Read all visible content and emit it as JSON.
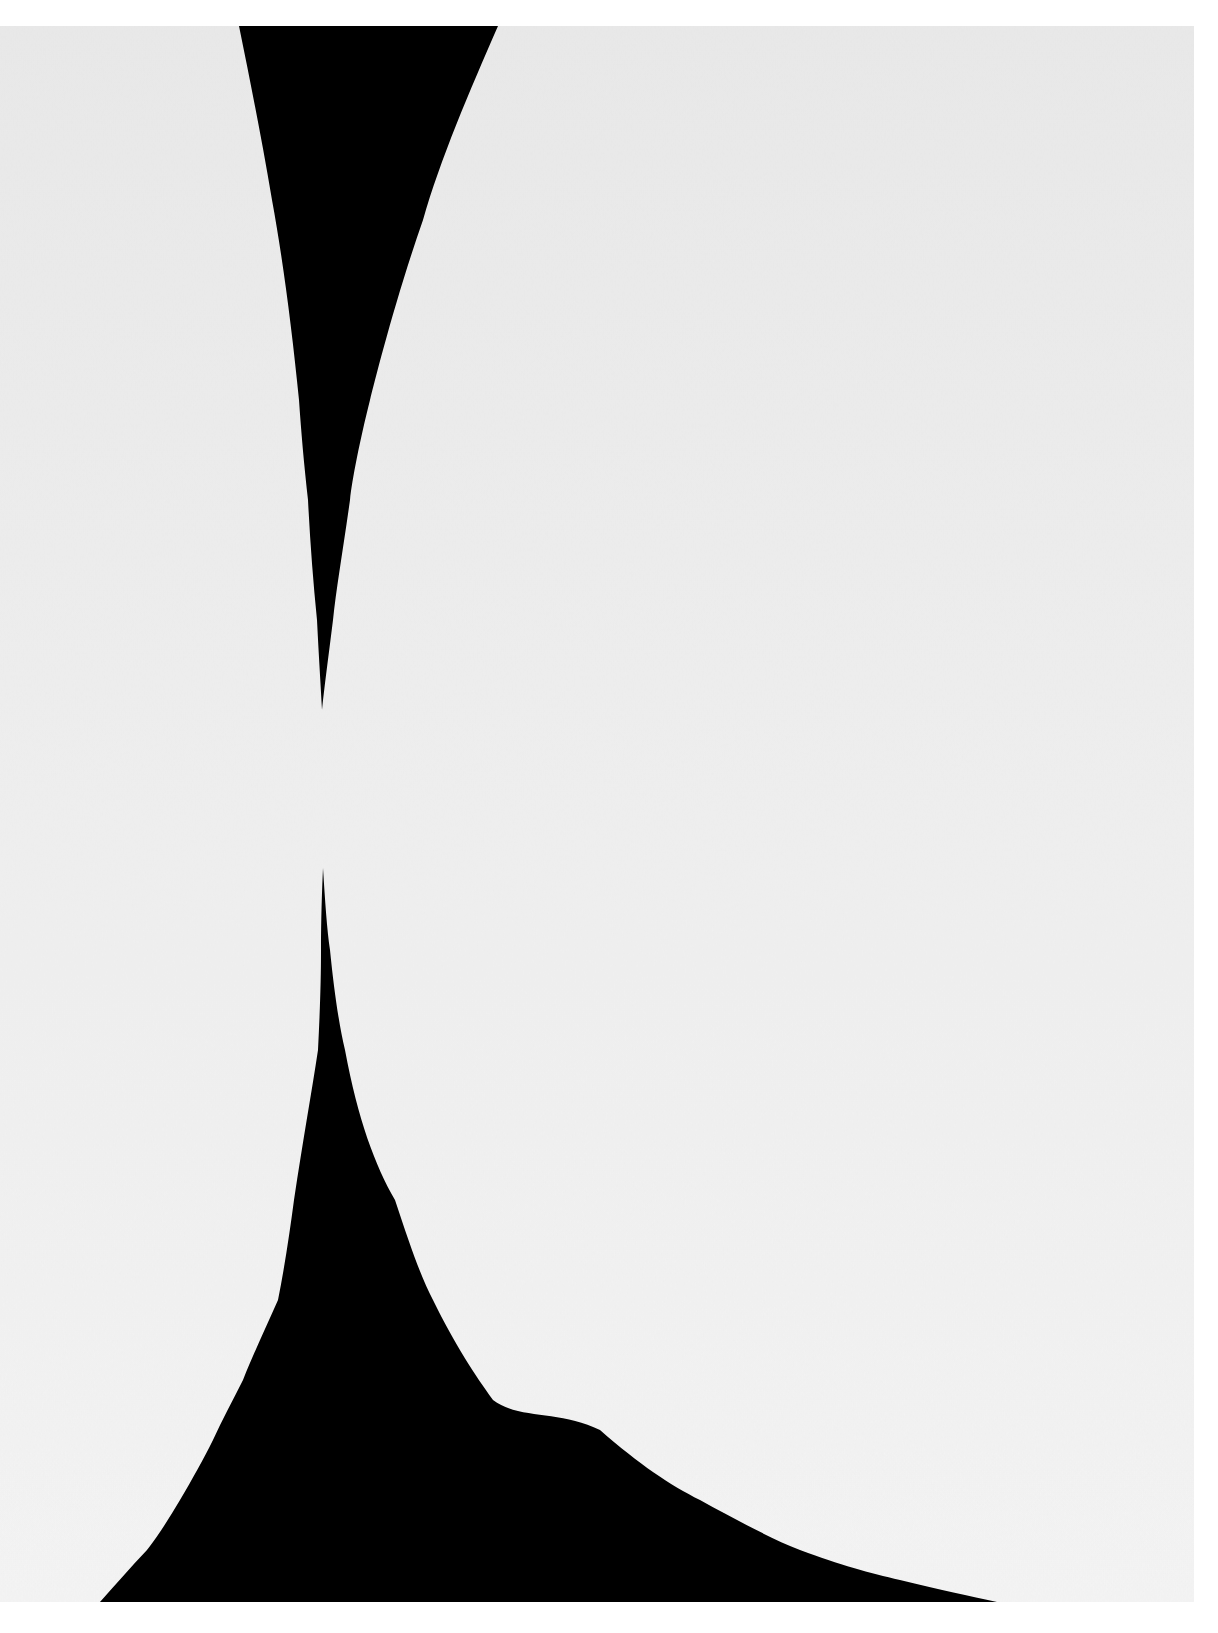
{
  "artwork": {
    "background_color": "#ffffff",
    "canvas": {
      "x": 0,
      "y": 26,
      "width": 1194,
      "height": 1576,
      "color_top": "#e9e9e9",
      "color_bottom": "#f4f4f4"
    },
    "shape_color": "#000000",
    "shapes": [
      {
        "name": "upper-black-wedge",
        "top_left": [
          239,
          26
        ],
        "top_right": [
          498,
          26
        ],
        "tip": [
          322,
          710
        ]
      },
      {
        "name": "lower-black-sweep",
        "tip": [
          323,
          868
        ],
        "bottom_left": [
          100,
          1600
        ],
        "bottom_right": [
          997,
          1602
        ]
      }
    ]
  }
}
